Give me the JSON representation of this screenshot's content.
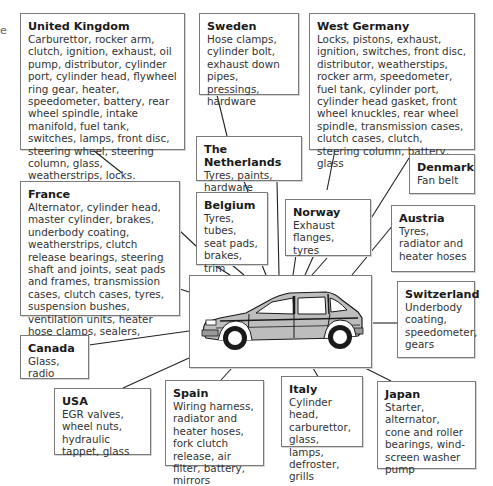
{
  "diagram": {
    "title": "",
    "edge_fragment": "e",
    "center": {
      "label": "car",
      "icon": "hatchback-car-icon"
    },
    "countries": [
      {
        "id": "uk",
        "country": "United Kingdom",
        "parts": "Carburettor, rocker  arm, clutch, ignition, exhaust, oil pump, distributor, cylinder port, cylinder head, flywheel ring gear, heater, speedometer, battery, rear wheel spindle, intake manifold, fuel tank, switches, lamps, front disc, steering wheel, steering column, glass, weatherstrips, locks."
      },
      {
        "id": "sweden",
        "country": "Sweden",
        "parts": "Hose clamps, cylinder bolt, exhaust down pipes, pressings, hardware"
      },
      {
        "id": "west-germany",
        "country": "West Germany",
        "parts": "Locks, pistons, exhaust, ignition, switches, front disc, distributor, weatherstips, rocker arm, speedometer, fuel tank, cylinder port, cylinder head gasket, front wheel knuckles, rear wheel spindle, transmission cases, clutch cases, clutch, steering column, battery, glass"
      },
      {
        "id": "netherlands",
        "country": "The Netherlands",
        "parts": "Tyres, paints, hardware"
      },
      {
        "id": "france",
        "country": "France",
        "parts": "Alternator, cylinder head, master cylinder, brakes, underbody coating, weatherstrips, clutch release bearings, steering shaft and joints, seat pads and frames, transmission cases, clutch cases, tyres, suspension bushes, ventilation units, heater hose clamps, sealers, hardware"
      },
      {
        "id": "belgium",
        "country": "Belgium",
        "parts": "Tyres, tubes, seat pads, brakes, trim"
      },
      {
        "id": "norway",
        "country": "Norway",
        "parts": "Exhaust flanges, tyres"
      },
      {
        "id": "denmark",
        "country": "Denmark",
        "parts": "Fan belt"
      },
      {
        "id": "austria",
        "country": "Austria",
        "parts": "Tyres, radiator and heater hoses"
      },
      {
        "id": "switzerland",
        "country": "Switzerland",
        "parts": "Underbody coating, speedometer, gears"
      },
      {
        "id": "canada",
        "country": "Canada",
        "parts": "Glass, radio"
      },
      {
        "id": "usa",
        "country": "USA",
        "parts": "EGR valves, wheel nuts, hydraulic tappet, glass"
      },
      {
        "id": "spain",
        "country": "Spain",
        "parts": "Wiring harness, radiator and heater hoses, fork clutch release, air filter, battery, mirrors"
      },
      {
        "id": "italy",
        "country": "Italy",
        "parts": "Cylinder head, carburettor, glass, lamps, defroster, grills"
      },
      {
        "id": "japan",
        "country": "Japan",
        "parts": "Starter, alternator, cone and roller bearings, wind-screen washer pump"
      }
    ],
    "colors": {
      "border": "#7a7a7a",
      "line": "#222222",
      "car_body": "#b8b8b8",
      "car_dark": "#1a1a1a"
    }
  }
}
